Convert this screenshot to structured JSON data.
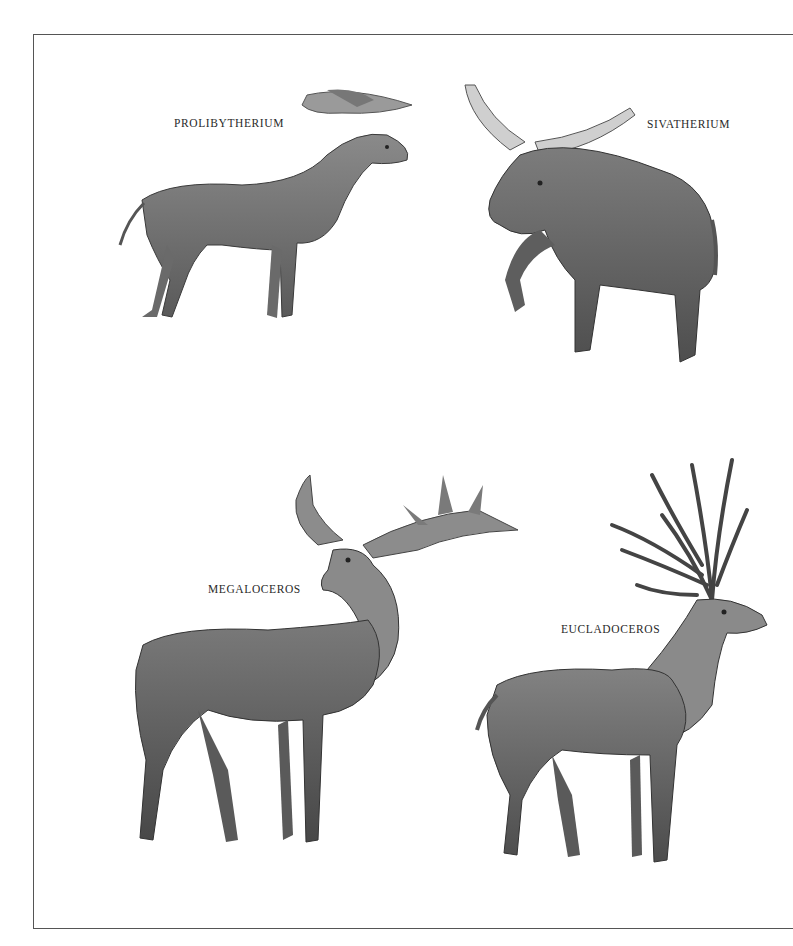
{
  "plate": {
    "frame_color": "#555555",
    "background": "#ffffff"
  },
  "animals": [
    {
      "id": "prolibytherium",
      "label": "PROLIBYTHERIUM",
      "position": "top-left"
    },
    {
      "id": "sivatherium",
      "label": "SIVATHERIUM",
      "position": "top-right"
    },
    {
      "id": "megaloceros",
      "label": "MEGALOCEROS",
      "position": "bottom-left"
    },
    {
      "id": "eucladoceros",
      "label": "EUCLADOCEROS",
      "position": "bottom-right"
    }
  ]
}
